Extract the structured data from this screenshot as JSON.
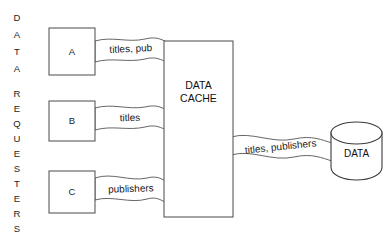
{
  "diagram": {
    "side_label": {
      "name": "data-requesters-vertical-label",
      "group_one": [
        "D",
        "A",
        "T",
        "A"
      ],
      "group_two": [
        "R",
        "E",
        "Q",
        "U",
        "E",
        "S",
        "T",
        "E",
        "R",
        "S"
      ],
      "full_text_one": "DATA",
      "full_text_two": "REQUESTERS"
    },
    "requesters": [
      {
        "id": "a",
        "label": "A"
      },
      {
        "id": "b",
        "label": "B"
      },
      {
        "id": "c",
        "label": "C"
      }
    ],
    "cache": {
      "line1": "DATA",
      "line2": "CACHE"
    },
    "database": {
      "label": "DATA"
    },
    "flows": [
      {
        "id": "flow-a",
        "label": "titles, pub",
        "from": "A",
        "to": "DATA CACHE"
      },
      {
        "id": "flow-b",
        "label": "titles",
        "from": "B",
        "to": "DATA CACHE"
      },
      {
        "id": "flow-c",
        "label": "publishers",
        "from": "C",
        "to": "DATA CACHE"
      },
      {
        "id": "flow-db",
        "label": "titles, publishers",
        "from": "DATA CACHE",
        "to": "DATA"
      }
    ],
    "colors": {
      "background": "#ffffff",
      "stroke": "#4a4a4a",
      "ribbon_stroke": "#555555",
      "text": "#1b1b1b"
    }
  }
}
